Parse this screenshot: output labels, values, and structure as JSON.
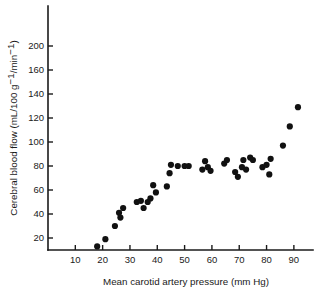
{
  "chart_data": {
    "type": "scatter",
    "title": "",
    "xlabel": "Mean carotid artery pressure (mm Hg)",
    "ylabel": "Cerebral blood flow (mL/100 g⁻¹/min⁻¹)",
    "xlabel_parts": {
      "text": "Mean carotid artery pressure (mm Hg)"
    },
    "ylabel_parts": {
      "segment_1": "Cerebral blood flow (mL/100 g",
      "superscript_1": "−1",
      "segment_2": "/min",
      "superscript_2": "−1",
      "segment_3": ")"
    },
    "xlim": [
      0,
      97
    ],
    "ylim": [
      0,
      210
    ],
    "xticks": [
      10,
      20,
      30,
      40,
      50,
      60,
      70,
      80,
      90
    ],
    "xtick_labels": [
      "10",
      "20",
      "30",
      "40",
      "50",
      "60",
      "70",
      "80",
      "90"
    ],
    "yticks": [
      20,
      40,
      60,
      80,
      100,
      120,
      140,
      160,
      200
    ],
    "ytick_labels": [
      "20",
      "40",
      "60",
      "80",
      "100",
      "120",
      "140",
      "160",
      "200"
    ],
    "grid": false,
    "legend": false,
    "marker": "filled-circle",
    "marker_color": "#111111",
    "marker_size_px": 4.4,
    "series": [
      {
        "name": "Cerebral blood flow",
        "points": [
          [
            18.0,
            13.0
          ],
          [
            21.0,
            19.0
          ],
          [
            24.5,
            30.0
          ],
          [
            26.0,
            41.0
          ],
          [
            26.5,
            37.0
          ],
          [
            27.5,
            45.0
          ],
          [
            32.5,
            50.0
          ],
          [
            34.0,
            51.0
          ],
          [
            35.0,
            45.0
          ],
          [
            36.5,
            50.0
          ],
          [
            37.5,
            53.0
          ],
          [
            38.5,
            64.0
          ],
          [
            39.5,
            58.0
          ],
          [
            43.5,
            63.0
          ],
          [
            44.5,
            74.0
          ],
          [
            45.0,
            81.0
          ],
          [
            47.5,
            80.0
          ],
          [
            50.0,
            80.0
          ],
          [
            51.5,
            80.0
          ],
          [
            56.5,
            77.0
          ],
          [
            57.5,
            84.0
          ],
          [
            58.5,
            79.0
          ],
          [
            59.5,
            76.0
          ],
          [
            64.5,
            82.0
          ],
          [
            65.5,
            85.0
          ],
          [
            68.5,
            75.0
          ],
          [
            69.5,
            71.0
          ],
          [
            71.0,
            79.0
          ],
          [
            71.5,
            85.0
          ],
          [
            72.5,
            77.0
          ],
          [
            74.0,
            87.0
          ],
          [
            75.0,
            85.0
          ],
          [
            78.5,
            79.0
          ],
          [
            80.0,
            81.0
          ],
          [
            81.0,
            73.0
          ],
          [
            81.5,
            86.0
          ],
          [
            86.0,
            97.0
          ],
          [
            88.5,
            113.0
          ],
          [
            91.5,
            129.0
          ]
        ]
      }
    ],
    "n_points": 39
  },
  "axes": {
    "y_axis_name": "y-axis",
    "x_axis_name": "x-axis"
  }
}
